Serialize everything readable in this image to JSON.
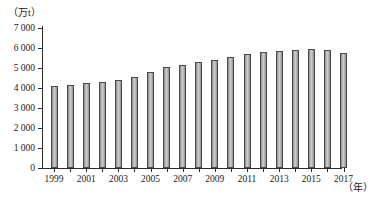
{
  "chart_data": {
    "type": "bar",
    "title": "",
    "subtitle": "",
    "xlabel": "（年）",
    "ylabel": "（万t）",
    "ylim": [
      0,
      7000
    ],
    "ytick_step": 1000,
    "grid": false,
    "legend": "none",
    "ytick_labels": [
      "7 000",
      "6 000",
      "5 000",
      "4 000",
      "3 000",
      "2 000",
      "1 000",
      "0"
    ],
    "ytick_values": [
      7000,
      6000,
      5000,
      4000,
      3000,
      2000,
      1000,
      0
    ],
    "xtick_label_step": 2,
    "xtick_labels": [
      "1999",
      "2001",
      "2003",
      "2005",
      "2007",
      "2009",
      "2011",
      "2013",
      "2015",
      "2017"
    ],
    "categories": [
      "1999",
      "2000",
      "2001",
      "2002",
      "2003",
      "2004",
      "2005",
      "2006",
      "2007",
      "2008",
      "2009",
      "2010",
      "2011",
      "2012",
      "2013",
      "2014",
      "2015",
      "2016",
      "2017"
    ],
    "values": [
      4120,
      4150,
      4250,
      4300,
      4400,
      4550,
      4800,
      5050,
      5150,
      5300,
      5400,
      5550,
      5700,
      5800,
      5850,
      5900,
      5950,
      5900,
      5750
    ],
    "series": [
      {
        "name": "产量",
        "values": [
          4120,
          4150,
          4250,
          4300,
          4400,
          4550,
          4800,
          5050,
          5150,
          5300,
          5400,
          5550,
          5700,
          5800,
          5850,
          5900,
          5950,
          5900,
          5750
        ]
      }
    ],
    "bar_color": "#c6c6c6",
    "bar_edge_color": "#4a4a4a",
    "axis_color": "#2b2b2b"
  }
}
